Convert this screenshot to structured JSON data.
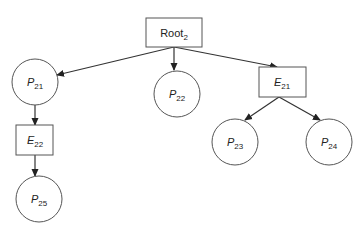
{
  "diagram": {
    "type": "tree",
    "colors": {
      "stroke": "#333333",
      "fill": "#ffffff",
      "text": "#222222"
    },
    "nodes": [
      {
        "id": "root2",
        "shape": "rect",
        "base": "Root",
        "sub": "2",
        "italic": false,
        "x": 146,
        "y": 18,
        "w": 56,
        "h": 29
      },
      {
        "id": "p21",
        "shape": "circle",
        "base": "P",
        "sub": "21",
        "italic": true,
        "cx": 35,
        "cy": 82,
        "r": 23
      },
      {
        "id": "p22",
        "shape": "circle",
        "base": "P",
        "sub": "22",
        "italic": true,
        "cx": 177,
        "cy": 94,
        "r": 23
      },
      {
        "id": "e21",
        "shape": "rect",
        "base": "E",
        "sub": "21",
        "italic": true,
        "x": 259,
        "y": 67,
        "w": 47,
        "h": 30
      },
      {
        "id": "e22",
        "shape": "rect",
        "base": "E",
        "sub": "22",
        "italic": true,
        "x": 16,
        "y": 125,
        "w": 37,
        "h": 30
      },
      {
        "id": "p23",
        "shape": "circle",
        "base": "P",
        "sub": "23",
        "italic": true,
        "cx": 235,
        "cy": 142,
        "r": 23
      },
      {
        "id": "p24",
        "shape": "circle",
        "base": "P",
        "sub": "24",
        "italic": true,
        "cx": 329,
        "cy": 142,
        "r": 23
      },
      {
        "id": "p25",
        "shape": "circle",
        "base": "P",
        "sub": "25",
        "italic": true,
        "cx": 39,
        "cy": 199,
        "r": 23
      }
    ],
    "edges": [
      {
        "from": "root2",
        "to": "p21"
      },
      {
        "from": "root2",
        "to": "p22"
      },
      {
        "from": "root2",
        "to": "e21"
      },
      {
        "from": "p21",
        "to": "e22"
      },
      {
        "from": "e22",
        "to": "p25"
      },
      {
        "from": "e21",
        "to": "p23"
      },
      {
        "from": "e21",
        "to": "p24"
      }
    ]
  }
}
